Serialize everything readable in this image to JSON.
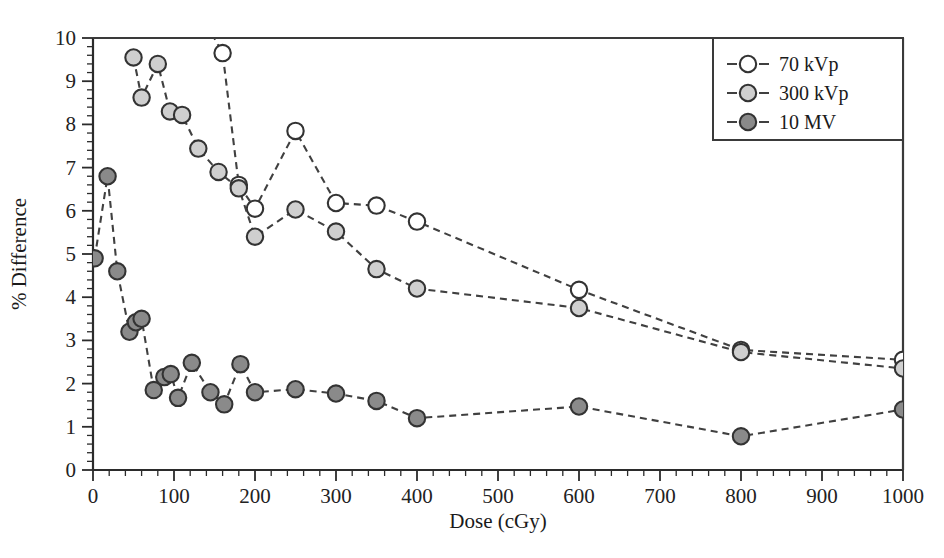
{
  "chart_data": {
    "type": "line",
    "title": "",
    "xlabel": "Dose (cGy)",
    "ylabel": "% Difference",
    "xlim": [
      0,
      1000
    ],
    "ylim": [
      0,
      10
    ],
    "xticks": [
      0,
      100,
      200,
      300,
      400,
      500,
      600,
      700,
      800,
      900,
      1000
    ],
    "yticks": [
      0,
      1,
      2,
      3,
      4,
      5,
      6,
      7,
      8,
      9,
      10
    ],
    "x_minor_step": 20,
    "y_minor_step": 0.2,
    "grid": false,
    "legend_position": "top-right",
    "series": [
      {
        "name": "70 kVp",
        "marker": "open-circle",
        "fill_color": "#ffffff",
        "edge_color": "#333333",
        "line_style": "dashed",
        "points": [
          {
            "x": 50,
            "y": 13.2
          },
          {
            "x": 60,
            "y": 12.4
          },
          {
            "x": 80,
            "y": 14.6
          },
          {
            "x": 100,
            "y": 12.0
          },
          {
            "x": 120,
            "y": 11.0
          },
          {
            "x": 160,
            "y": 9.65
          },
          {
            "x": 180,
            "y": 6.6
          },
          {
            "x": 200,
            "y": 6.05
          },
          {
            "x": 250,
            "y": 7.85
          },
          {
            "x": 300,
            "y": 6.18
          },
          {
            "x": 350,
            "y": 6.12
          },
          {
            "x": 400,
            "y": 5.75
          },
          {
            "x": 600,
            "y": 4.17
          },
          {
            "x": 800,
            "y": 2.78
          },
          {
            "x": 1000,
            "y": 2.55
          }
        ]
      },
      {
        "name": "300 kVp",
        "marker": "filled-circle-light",
        "fill_color": "#cfcfcf",
        "edge_color": "#333333",
        "line_style": "dashed",
        "points": [
          {
            "x": 50,
            "y": 9.55
          },
          {
            "x": 60,
            "y": 8.62
          },
          {
            "x": 80,
            "y": 9.4
          },
          {
            "x": 95,
            "y": 8.3
          },
          {
            "x": 110,
            "y": 8.22
          },
          {
            "x": 130,
            "y": 7.44
          },
          {
            "x": 155,
            "y": 6.9
          },
          {
            "x": 180,
            "y": 6.52
          },
          {
            "x": 200,
            "y": 5.4
          },
          {
            "x": 250,
            "y": 6.03
          },
          {
            "x": 300,
            "y": 5.52
          },
          {
            "x": 350,
            "y": 4.65
          },
          {
            "x": 400,
            "y": 4.2
          },
          {
            "x": 600,
            "y": 3.75
          },
          {
            "x": 800,
            "y": 2.73
          },
          {
            "x": 1000,
            "y": 2.35
          }
        ]
      },
      {
        "name": "10 MV",
        "marker": "filled-circle-dark",
        "fill_color": "#8a8a8a",
        "edge_color": "#333333",
        "line_style": "dashed",
        "points": [
          {
            "x": 2,
            "y": 4.9
          },
          {
            "x": 18,
            "y": 6.8
          },
          {
            "x": 30,
            "y": 4.6
          },
          {
            "x": 45,
            "y": 3.2
          },
          {
            "x": 53,
            "y": 3.42
          },
          {
            "x": 60,
            "y": 3.5
          },
          {
            "x": 75,
            "y": 1.85
          },
          {
            "x": 88,
            "y": 2.15
          },
          {
            "x": 96,
            "y": 2.22
          },
          {
            "x": 105,
            "y": 1.67
          },
          {
            "x": 122,
            "y": 2.48
          },
          {
            "x": 145,
            "y": 1.8
          },
          {
            "x": 162,
            "y": 1.52
          },
          {
            "x": 182,
            "y": 2.45
          },
          {
            "x": 200,
            "y": 1.8
          },
          {
            "x": 250,
            "y": 1.87
          },
          {
            "x": 300,
            "y": 1.77
          },
          {
            "x": 350,
            "y": 1.6
          },
          {
            "x": 400,
            "y": 1.2
          },
          {
            "x": 600,
            "y": 1.47
          },
          {
            "x": 800,
            "y": 0.78
          },
          {
            "x": 1000,
            "y": 1.4
          }
        ]
      }
    ]
  },
  "legend": {
    "entries": [
      {
        "label": "70 kVp"
      },
      {
        "label": "300 kVp"
      },
      {
        "label": "10 MV"
      }
    ]
  },
  "colors": {
    "axis": "#2b2b2b",
    "line": "#404040",
    "series_70kvp": "#ffffff",
    "series_300kvp": "#cfcfcf",
    "series_10mv": "#8a8a8a"
  }
}
